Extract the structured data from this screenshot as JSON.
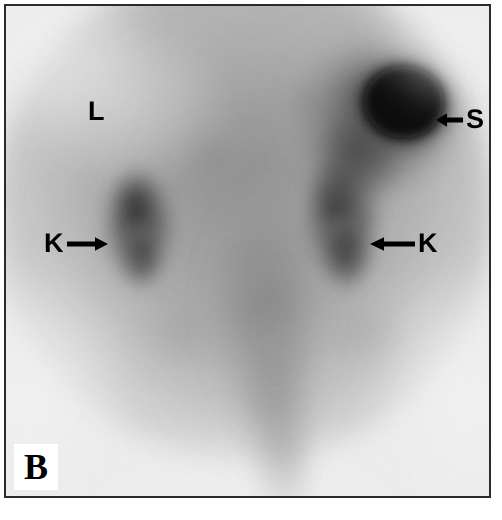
{
  "figure": {
    "kind": "scintigraphy-scan",
    "modality": "nuclear-medicine-planar-scintigram",
    "panel_letter": "B",
    "frame_color": "#2b2b2b",
    "background_color": "#ffffff"
  },
  "image": {
    "film_base_color": "#efefef",
    "mid_tone_color": "#a0a0a0",
    "hotspot_color": "#0a0a0a",
    "noise_description": "fine film grain speckle"
  },
  "annotations": [
    {
      "id": "label-liver",
      "letter": "L",
      "name": "liver-label",
      "arrow": "none",
      "x": 82,
      "y": 92,
      "font_size": 27
    },
    {
      "id": "label-spleen",
      "letter": "S",
      "name": "spleen-label",
      "arrow": "left",
      "x": 428,
      "y": 100,
      "font_size": 27
    },
    {
      "id": "label-kidney-left",
      "letter": "K",
      "name": "kidney-left-label",
      "arrow": "right",
      "x": 38,
      "y": 224,
      "font_size": 27
    },
    {
      "id": "label-kidney-right",
      "letter": "K",
      "name": "kidney-right-label",
      "arrow": "left",
      "x": 362,
      "y": 224,
      "font_size": 27
    }
  ],
  "uptake_regions": [
    {
      "name": "spleen",
      "label": "S",
      "intensity": "very-high",
      "cx": 400,
      "cy": 100,
      "rx": 52,
      "ry": 46
    },
    {
      "name": "spleen-halo",
      "label": "",
      "intensity": "high",
      "cx": 378,
      "cy": 110,
      "rx": 86,
      "ry": 80
    },
    {
      "name": "kidney-left",
      "label": "K",
      "intensity": "moderate",
      "cx": 137,
      "cy": 222,
      "rx": 40,
      "ry": 62
    },
    {
      "name": "kidney-right",
      "label": "K",
      "intensity": "moderate",
      "cx": 340,
      "cy": 215,
      "rx": 42,
      "ry": 70
    },
    {
      "name": "axial-midline",
      "label": "",
      "intensity": "low",
      "cx": 270,
      "cy": 330,
      "rx": 70,
      "ry": 130
    },
    {
      "name": "liver-bed",
      "label": "L",
      "intensity": "background",
      "cx": 120,
      "cy": 110,
      "rx": 110,
      "ry": 80
    }
  ]
}
